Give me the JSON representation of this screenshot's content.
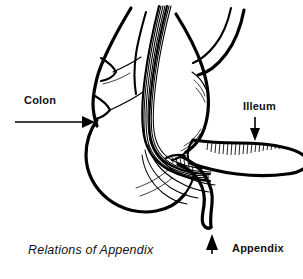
{
  "figure": {
    "title": "Relations of Appendix",
    "background_color": "#ffffff",
    "ink_color": "#000000",
    "style": "black-and-white line art anatomical illustration"
  },
  "caption": {
    "text": "Relations of Appendix",
    "style": "italic"
  },
  "labels": [
    {
      "id": "colon",
      "text": "Colon",
      "pointer": "arrow-right",
      "arrow_direction": "right",
      "target": "ascending colon"
    },
    {
      "id": "illeum",
      "text": "Illeum",
      "pointer": "arrow-down",
      "arrow_direction": "down",
      "target": "ileum"
    },
    {
      "id": "appendix",
      "text": "Appendix",
      "pointer": "arrow-up",
      "arrow_direction": "up",
      "target": "vermiform appendix tip"
    }
  ],
  "anatomy": {
    "parts": [
      "ascending colon",
      "taenia coli",
      "cecum",
      "ileum",
      "ileocecal junction",
      "vermiform appendix",
      "mesoappendix"
    ]
  }
}
